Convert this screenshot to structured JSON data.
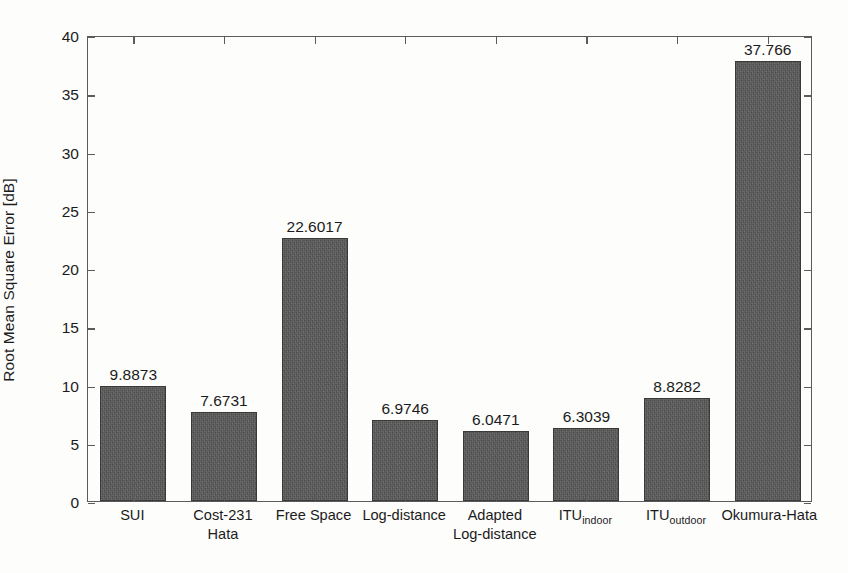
{
  "chart_data": {
    "type": "bar",
    "title": "",
    "xlabel": "",
    "ylabel": "Root Mean Square Error [dB]",
    "ylim": [
      0,
      40
    ],
    "ytick_step": 5,
    "yticks": [
      "40",
      "35",
      "30",
      "25",
      "20",
      "15",
      "10",
      "5",
      "0"
    ],
    "ytick_values": [
      40,
      35,
      30,
      25,
      20,
      15,
      10,
      5,
      0
    ],
    "grid": false,
    "legend": null,
    "bar_color": "#595959",
    "bar_edge_color": "#3a3a3a",
    "axis_color": "#5b5b5b",
    "background_color": "#fdfdfc",
    "categories": [
      "SUI",
      "Cost-231 Hata",
      "Free Space",
      "Log-distance",
      "Adapted Log-distance",
      "ITU indoor",
      "ITU outdoor",
      "Okumura-Hata"
    ],
    "values": [
      9.8873,
      7.6731,
      22.6017,
      6.9746,
      6.0471,
      6.3039,
      8.8282,
      37.766
    ],
    "value_labels": [
      "9.8873",
      "7.6731",
      "22.6017",
      "6.9746",
      "6.0471",
      "6.3039",
      "8.8282",
      "37.766"
    ]
  },
  "xtick_labels": [
    {
      "line1": "SUI",
      "line2": ""
    },
    {
      "line1": "Cost-231",
      "line2": "Hata"
    },
    {
      "line1": "Free Space",
      "line2": ""
    },
    {
      "line1": "Log-distance",
      "line2": ""
    },
    {
      "line1": "Adapted",
      "line2": "Log-distance"
    },
    {
      "line1": "ITU",
      "line2": "",
      "sub": "indoor"
    },
    {
      "line1": "ITU",
      "line2": "",
      "sub": "outdoor"
    },
    {
      "line1": "Okumura-Hata",
      "line2": ""
    }
  ]
}
